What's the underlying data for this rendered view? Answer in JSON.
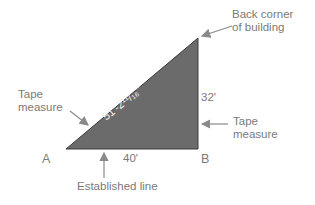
{
  "diagram": {
    "triangle": {
      "fill_color": "#6b6b6b",
      "edge_color": "#3a3a3a",
      "vertices": {
        "A": [
          66,
          149
        ],
        "B": [
          198,
          149
        ],
        "top": [
          198,
          38
        ]
      },
      "hypotenuse_label": "51'-2¹¹/₁₆\"",
      "vertical_label": "32'",
      "base_label": "40'"
    },
    "points": {
      "a": "A",
      "b": "B"
    },
    "callouts": {
      "back_corner_line1": "Back corner",
      "back_corner_line2": "of building",
      "tape_left_line1": "Tape",
      "tape_left_line2": "measure",
      "tape_right_line1": "Tape",
      "tape_right_line2": "measure",
      "established_line": "Established line"
    },
    "arrow_color": "#8a8a8a"
  }
}
